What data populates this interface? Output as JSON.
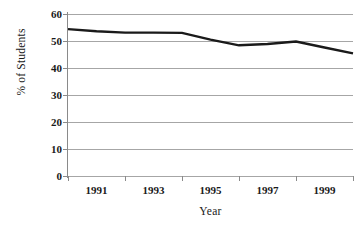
{
  "chart_data": {
    "type": "line",
    "title": "",
    "xlabel": "Year",
    "ylabel": "% of Students",
    "x": [
      1991,
      1992,
      1993,
      1994,
      1995,
      1996,
      1997,
      1998,
      1999,
      2000,
      2001
    ],
    "categories": [
      "1991",
      "1992",
      "1993",
      "1994",
      "1995",
      "1996",
      "1997",
      "1998",
      "1999",
      "2000",
      "2001"
    ],
    "values": [
      54.4,
      53.6,
      53.1,
      53.1,
      53.0,
      50.5,
      48.4,
      48.9,
      49.8,
      47.6,
      45.4
    ],
    "series": [
      {
        "name": "% of Students",
        "values": [
          54.4,
          53.6,
          53.1,
          53.1,
          53.0,
          50.5,
          48.4,
          48.9,
          49.8,
          47.6,
          45.4
        ]
      }
    ],
    "xlim": [
      1991,
      2001
    ],
    "ylim": [
      0,
      60
    ],
    "ytick_values": [
      0,
      10,
      20,
      30,
      40,
      50,
      60
    ],
    "ytick_labels": [
      "0",
      "10",
      "20",
      "30",
      "40",
      "50",
      "60"
    ],
    "xtick_labels": [
      "1991",
      "1993",
      "1995",
      "1997",
      "1999",
      "2001"
    ],
    "xtick_values": [
      1991,
      1993,
      1995,
      1997,
      1999,
      2001
    ],
    "grid": "horizontal",
    "legend": "none",
    "line_color": "#1a1a1a",
    "line_width": 2.4,
    "gridline_color": "#a6a6a6",
    "axis_color": "#8a8a8a",
    "background": "#ffffff",
    "markers": "none"
  }
}
